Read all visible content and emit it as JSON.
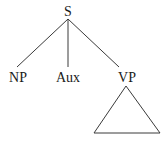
{
  "tree": {
    "root": "S",
    "children": [
      {
        "label": "NP"
      },
      {
        "label": "Aux"
      },
      {
        "label": "VP",
        "subtree": "triangle"
      }
    ]
  }
}
